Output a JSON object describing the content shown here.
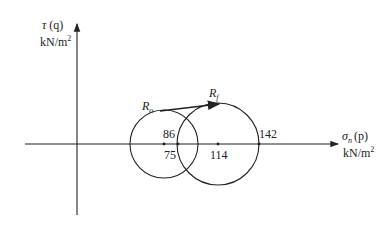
{
  "diagram": {
    "type": "mohr-circle",
    "y_axis": {
      "label": "τ (q)",
      "unit": "kN/m²"
    },
    "x_axis": {
      "label": "σn (p)",
      "unit": "kN/m²"
    },
    "points": {
      "Ro": {
        "label": "Ro"
      },
      "Rf": {
        "label": "Rf"
      }
    },
    "values": {
      "small_center": "86",
      "small_left_intersect": "75",
      "large_center": "114",
      "large_right": "142"
    },
    "circles": [
      {
        "name": "initial",
        "center": 86,
        "left": 30,
        "right": 142
      },
      {
        "name": "final",
        "center": 114,
        "left": 75,
        "right": 142
      }
    ]
  },
  "labels": {
    "tau": "τ",
    "q": "(q)",
    "kn": "kN/m",
    "sq": "2",
    "sigma": "σ",
    "n": "n",
    "p": "(p)",
    "R": "R",
    "o": "o",
    "f": "f",
    "v86": "86",
    "v75": "75",
    "v114": "114",
    "v142": "142"
  },
  "colors": {
    "line": "#222222",
    "background": "#ffffff"
  }
}
